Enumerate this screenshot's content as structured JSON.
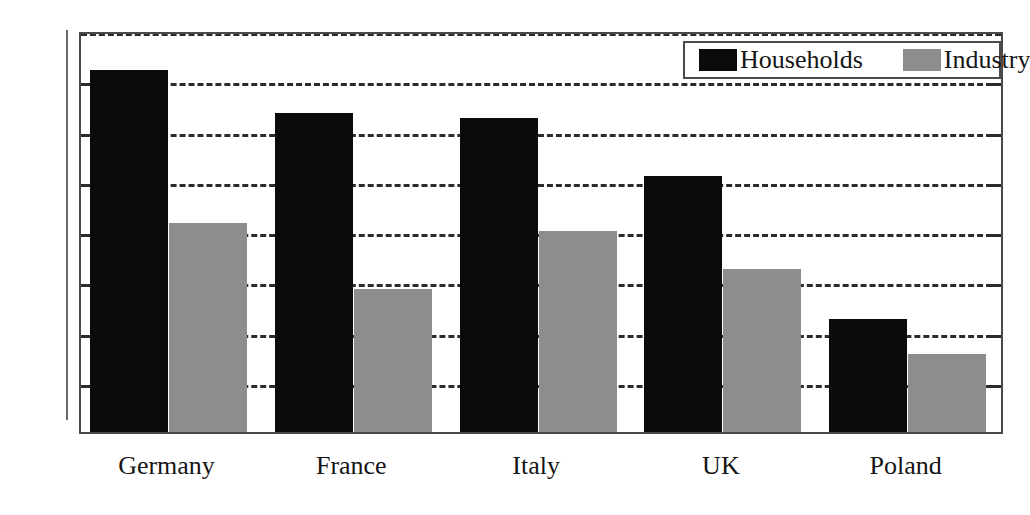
{
  "chart_data": {
    "type": "bar",
    "title": "",
    "xlabel": "",
    "ylabel": "",
    "categories": [
      "Germany",
      "France",
      "Italy",
      "UK",
      "Poland"
    ],
    "series": [
      {
        "name": "Households",
        "color": "#0b0b0b",
        "values": [
          144,
          127,
          125,
          102,
          45
        ]
      },
      {
        "name": "Industry",
        "color": "#8d8d8d",
        "values": [
          83,
          57,
          80,
          65,
          31
        ]
      }
    ],
    "ylim": [
      0,
      160
    ],
    "ytick_step": 20,
    "yticks": [
      0,
      20,
      40,
      60,
      80,
      100,
      120,
      140,
      160
    ],
    "ytick_labels": [
      "0",
      "20",
      "40",
      "60",
      "80",
      "100",
      "120",
      "140",
      "160"
    ],
    "grid": true,
    "grid_style": "dashed",
    "grid_axis": "y",
    "legend_position": "top-right",
    "legend_entries": [
      "Households",
      "Industry"
    ]
  }
}
